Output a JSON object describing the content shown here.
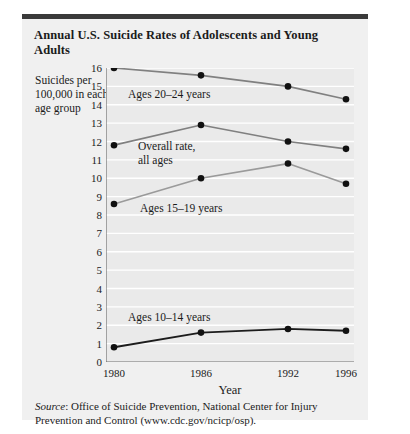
{
  "card": {
    "title": "Annual U.S. Suicide Rates of Adolescents and Young Adults",
    "y_axis_caption": "Suicides per 100,000 in each age group",
    "source_prefix": "Source",
    "source_text": ": Office of Suicide Prevention, National Center for Injury Prevention and Control (www.cdc.gov/ncicp/osp)."
  },
  "chart_data": {
    "type": "line",
    "title": "Annual U.S. Suicide Rates of Adolescents and Young Adults",
    "xlabel": "Year",
    "ylabel": "Suicides per 100,000 in each age group",
    "categories": [
      "1980",
      "1986",
      "1992",
      "1996"
    ],
    "x": [
      1980,
      1986,
      1992,
      1996
    ],
    "xlim": [
      1980,
      1996
    ],
    "ylim": [
      0,
      16
    ],
    "yticks": [
      0,
      1,
      2,
      3,
      4,
      5,
      6,
      7,
      8,
      9,
      10,
      11,
      12,
      13,
      14,
      15,
      16
    ],
    "xticks": [
      "1980",
      "1986",
      "1992",
      "1996"
    ],
    "grid": true,
    "legend": "inline-annotations",
    "series": [
      {
        "name": "Ages 20–24 years",
        "values": [
          16.0,
          15.6,
          15.0,
          14.3
        ],
        "color": "#808080"
      },
      {
        "name": "Overall rate, all ages",
        "values": [
          11.8,
          12.9,
          12.0,
          11.6
        ],
        "color": "#808080"
      },
      {
        "name": "Ages 15–19 years",
        "values": [
          8.6,
          10.0,
          10.8,
          9.7
        ],
        "color": "#9a9a9a"
      },
      {
        "name": "Ages 10–14 years",
        "values": [
          0.8,
          1.6,
          1.8,
          1.7
        ],
        "color": "#1c1c1c"
      }
    ],
    "annotations": [
      {
        "text": "Ages 20–24 years",
        "x_px": 22,
        "y_px": 20
      },
      {
        "text": "Overall rate,\nall ages",
        "x_px": 32,
        "y_px": 72
      },
      {
        "text": "Ages 15–19 years",
        "x_px": 34,
        "y_px": 134
      },
      {
        "text": "Ages 10–14 years",
        "x_px": 22,
        "y_px": 243
      }
    ]
  }
}
